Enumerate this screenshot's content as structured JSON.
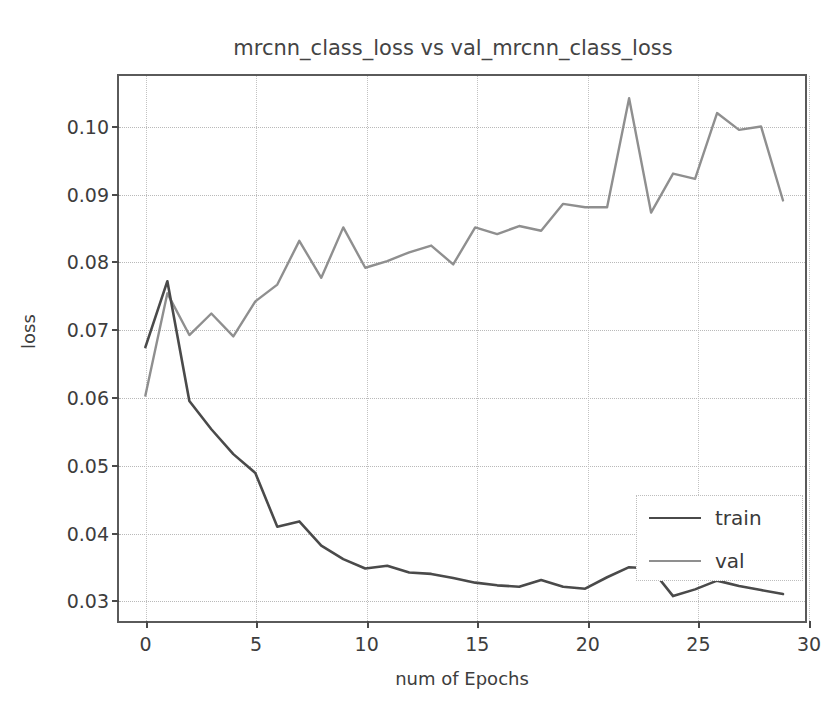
{
  "chart_data": {
    "type": "line",
    "title": "mrcnn_class_loss vs val_mrcnn_class_loss",
    "xlabel": "num of Epochs",
    "ylabel": "loss",
    "xlim": [
      -1.2,
      30
    ],
    "ylim": [
      0.0265,
      0.1075
    ],
    "xticks": [
      0,
      5,
      10,
      15,
      20,
      25,
      30
    ],
    "xtick_labels": [
      "0",
      "5",
      "10",
      "15",
      "20",
      "25",
      "30"
    ],
    "yticks": [
      0.03,
      0.04,
      0.05,
      0.06,
      0.07,
      0.08,
      0.09,
      0.1
    ],
    "ytick_labels": [
      "0.03",
      "0.04",
      "0.05",
      "0.06",
      "0.07",
      "0.08",
      "0.09",
      "0.10"
    ],
    "grid": true,
    "legend_position": "lower right",
    "x": [
      0,
      1,
      2,
      3,
      4,
      5,
      6,
      7,
      8,
      9,
      10,
      11,
      12,
      13,
      14,
      15,
      16,
      17,
      18,
      19,
      20,
      21,
      22,
      23,
      24,
      25,
      26,
      27,
      28,
      29
    ],
    "series": [
      {
        "name": "train",
        "color": "#4a4a4a",
        "values": [
          0.0672,
          0.077,
          0.0592,
          0.055,
          0.0513,
          0.0485,
          0.0405,
          0.0413,
          0.0377,
          0.0357,
          0.0343,
          0.0347,
          0.0337,
          0.0335,
          0.0329,
          0.0322,
          0.0318,
          0.0316,
          0.0326,
          0.0316,
          0.0313,
          0.033,
          0.0345,
          0.0343,
          0.0302,
          0.0312,
          0.0325,
          0.0317,
          0.0311,
          0.0305
        ]
      },
      {
        "name": "val",
        "color": "#8f8f8f",
        "values": [
          0.06,
          0.0752,
          0.069,
          0.0722,
          0.0688,
          0.074,
          0.0765,
          0.083,
          0.0775,
          0.085,
          0.079,
          0.08,
          0.0813,
          0.0823,
          0.0795,
          0.085,
          0.084,
          0.0852,
          0.0845,
          0.0885,
          0.088,
          0.088,
          0.1042,
          0.0872,
          0.093,
          0.0922,
          0.102,
          0.0995,
          0.1,
          0.089
        ]
      }
    ]
  },
  "legend": {
    "entries": [
      {
        "label": "train",
        "color": "#4a4a4a"
      },
      {
        "label": "val",
        "color": "#8f8f8f"
      }
    ]
  },
  "scan_artifact": {
    "bottom_text": ""
  }
}
